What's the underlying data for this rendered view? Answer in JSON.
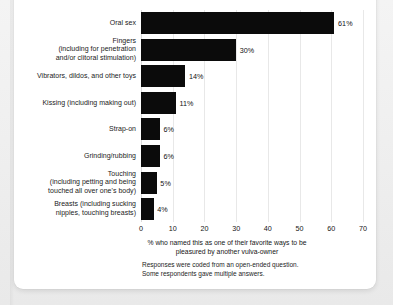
{
  "chart_data": {
    "type": "bar",
    "orientation": "horizontal",
    "title": "",
    "xlabel": "% who named this as one of their favorite ways to be\npleasured by another vulva-owner",
    "ylabel": "",
    "xlim": [
      0,
      70
    ],
    "xticks": [
      0,
      10,
      20,
      30,
      40,
      50,
      60,
      70
    ],
    "xtick_labels": [
      "0",
      "10",
      "20",
      "30",
      "40",
      "50",
      "60",
      "70"
    ],
    "grid": true,
    "legend": false,
    "bar_color": "#0b0b0b",
    "categories": [
      "Oral sex",
      "Fingers\n(including for penetration\nand/or clitoral stimulation)",
      "Vibrators, dildos, and other toys",
      "Kissing (including making out)",
      "Strap-on",
      "Grinding/rubbing",
      "Touching\n(including petting and being\ntouched all over one's body)",
      "Breasts (including sucking\nnipples, touching breasts)"
    ],
    "values": [
      61,
      30,
      14,
      11,
      6,
      6,
      5,
      4
    ],
    "value_labels": [
      "61%",
      "30%",
      "14%",
      "11%",
      "6%",
      "6%",
      "5%",
      "4%"
    ],
    "annotations": [
      "Responses were coded from an open-ended question.",
      "Some respondents gave multiple answers."
    ],
    "footnote": "Responses were coded from an open-ended question.\nSome respondents gave multiple answers."
  }
}
